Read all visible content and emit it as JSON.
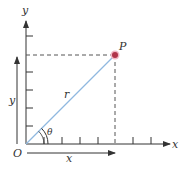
{
  "diagram": {
    "type": "polar-coordinates",
    "labels": {
      "y_axis": "y",
      "x_axis": "x",
      "origin": "O",
      "point": "P",
      "radius": "r",
      "angle": "θ",
      "y_length": "y",
      "x_length": "x"
    },
    "colors": {
      "axis": "#333333",
      "radius_line": "#8fb8e0",
      "point": "#b0334a",
      "point_halo": "#f2b8c6",
      "dashed": "#555555"
    }
  }
}
